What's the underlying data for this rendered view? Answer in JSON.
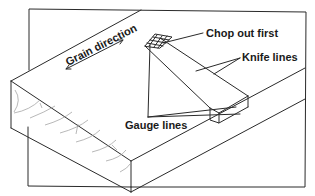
{
  "diagram": {
    "labels": {
      "grain_direction": "Grain direction",
      "chop_out_first": "Chop out first",
      "knife_lines": "Knife lines",
      "gauge_lines": "Gauge lines"
    },
    "colors": {
      "line": "#2a2a2a",
      "grain": "#9a9a9a",
      "background": "#ffffff"
    }
  }
}
